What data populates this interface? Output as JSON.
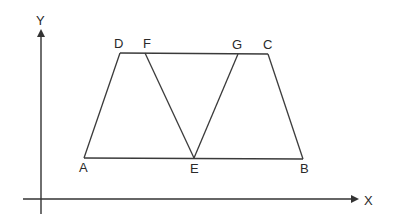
{
  "diagram": {
    "type": "geometry",
    "axes": {
      "x_label": "X",
      "y_label": "Y",
      "origin": [
        41,
        199
      ],
      "x_axis_end": [
        357,
        199
      ],
      "y_axis_end": [
        41,
        30
      ]
    },
    "points": [
      {
        "name": "A",
        "x": 84,
        "y": 158,
        "label_x": 79,
        "label_y": 172
      },
      {
        "name": "B",
        "x": 303,
        "y": 159,
        "label_x": 300,
        "label_y": 173
      },
      {
        "name": "C",
        "x": 268,
        "y": 54,
        "label_x": 263,
        "label_y": 49
      },
      {
        "name": "D",
        "x": 120,
        "y": 53,
        "label_x": 114,
        "label_y": 48
      },
      {
        "name": "E",
        "x": 194,
        "y": 158,
        "label_x": 190,
        "label_y": 173
      },
      {
        "name": "F",
        "x": 145,
        "y": 53,
        "label_x": 143,
        "label_y": 48
      },
      {
        "name": "G",
        "x": 238,
        "y": 54,
        "label_x": 232,
        "label_y": 49
      }
    ],
    "segments": [
      {
        "from": "A",
        "to": "D"
      },
      {
        "from": "D",
        "to": "C"
      },
      {
        "from": "C",
        "to": "B"
      },
      {
        "from": "B",
        "to": "A"
      },
      {
        "from": "F",
        "to": "E"
      },
      {
        "from": "G",
        "to": "E"
      }
    ]
  },
  "labels": {
    "A": "A",
    "B": "B",
    "C": "C",
    "D": "D",
    "E": "E",
    "F": "F",
    "G": "G",
    "X": "X",
    "Y": "Y"
  }
}
